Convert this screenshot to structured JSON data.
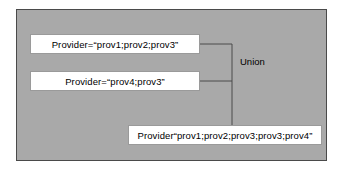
{
  "diagram": {
    "panel": {
      "background_color": "#a9a9a9",
      "border_color": "#4a4a4a"
    },
    "nodes": [
      {
        "id": "input-1",
        "label": "Provider=“prov1;prov2;prov3”"
      },
      {
        "id": "input-2",
        "label": "Provider=“prov4;prov3”"
      },
      {
        "id": "output",
        "label": "Provider“prov1;prov2;prov3;prov3;prov4”"
      }
    ],
    "operation_label": "Union",
    "connector_color": "#4a4a4a"
  }
}
